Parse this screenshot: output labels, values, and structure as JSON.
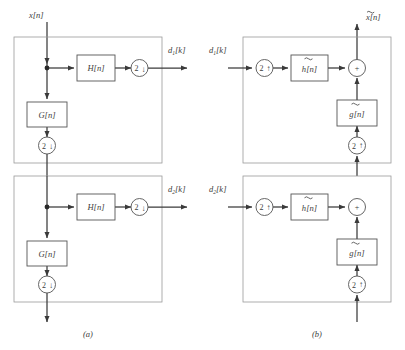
{
  "figure": {
    "width": 405,
    "height": 350,
    "background": "#ffffff",
    "line_color": "#3a3a3a",
    "panel_border_color": "#9a9a9a",
    "block_stroke": "#555555"
  },
  "captions": {
    "a": "(a)",
    "b": "(b)"
  },
  "panel_a": {
    "name": "analysis-side",
    "input_label": "x[n]",
    "stages": [
      {
        "id": "stage-1",
        "filter_block": "H[n]",
        "lowpass_block": "G[n]",
        "downsampler_top": "2",
        "downsampler_bottom": "2",
        "arrow_glyph": "↓",
        "output_label_base": "d",
        "output_label_sub": "1",
        "output_label_tail": "[k]"
      },
      {
        "id": "stage-2",
        "filter_block": "H[n]",
        "lowpass_block": "G[n]",
        "downsampler_top": "2",
        "downsampler_bottom": "2",
        "arrow_glyph": "↓",
        "output_label_base": "d",
        "output_label_sub": "2",
        "output_label_tail": "[k]"
      }
    ]
  },
  "panel_b": {
    "name": "synthesis-side",
    "output_label": "x̃[n]",
    "output_label_base": "x",
    "output_label_tail": "[n]",
    "stages": [
      {
        "id": "stage-1",
        "input_label_base": "d",
        "input_label_sub": "1",
        "input_label_tail": "[k]",
        "upsampler_left": "2",
        "upsampler_bottom": "2",
        "arrow_glyph": "↑",
        "filter_block_base": "h",
        "filter_block_tail": "[n]",
        "lowpass_block_base": "g",
        "lowpass_block_tail": "[n]",
        "adder": "+"
      },
      {
        "id": "stage-2",
        "input_label_base": "d",
        "input_label_sub": "2",
        "input_label_tail": "[k]",
        "upsampler_left": "2",
        "upsampler_bottom": "2",
        "arrow_glyph": "↑",
        "filter_block_base": "h",
        "filter_block_tail": "[n]",
        "lowpass_block_base": "g",
        "lowpass_block_tail": "[n]",
        "adder": "+"
      }
    ]
  }
}
